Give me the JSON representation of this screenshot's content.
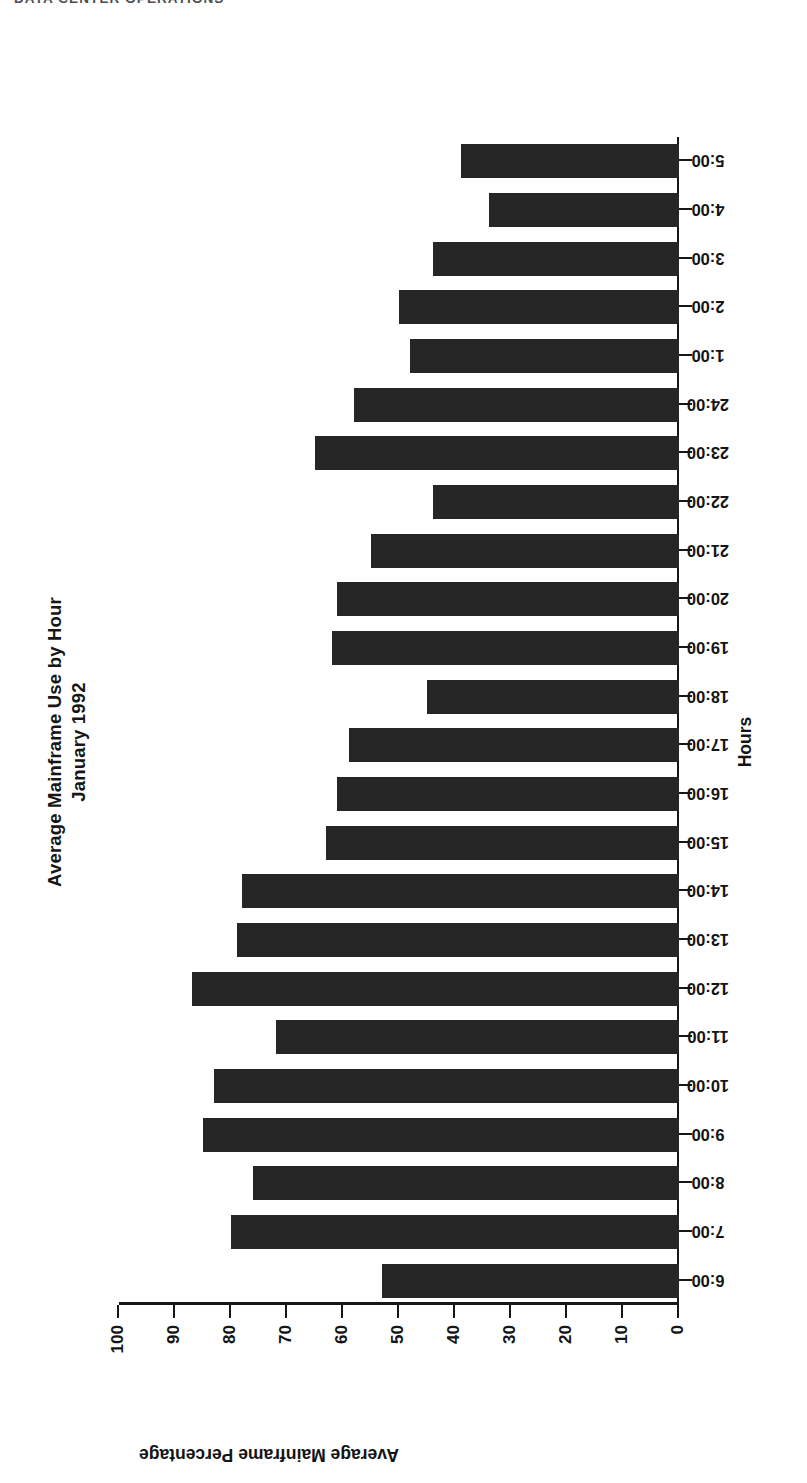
{
  "page": {
    "header_text": "DATA CENTER OPERATIONS"
  },
  "chart_data": {
    "type": "bar",
    "orientation": "horizontal-on-page",
    "title": "Average Mainframe Use by Hour",
    "subtitle": "January 1992",
    "xlabel": "Hours",
    "ylabel": "Average Mainframe Percentage",
    "ylim": [
      0,
      100
    ],
    "ytick_labels": [
      "0",
      "10",
      "20",
      "30",
      "40",
      "50",
      "60",
      "70",
      "80",
      "90",
      "100"
    ],
    "ytick_values": [
      0,
      10,
      20,
      30,
      40,
      50,
      60,
      70,
      80,
      90,
      100
    ],
    "grid": false,
    "legend": false,
    "categories": [
      "6:00",
      "7:00",
      "8:00",
      "9:00",
      "10:00",
      "11:00",
      "12:00",
      "13:00",
      "14:00",
      "15:00",
      "16:00",
      "17:00",
      "18:00",
      "19:00",
      "20:00",
      "21:00",
      "22:00",
      "23:00",
      "24:00",
      "1:00",
      "2:00",
      "3:00",
      "4:00",
      "5:00"
    ],
    "values": [
      53,
      80,
      76,
      85,
      83,
      72,
      87,
      79,
      78,
      63,
      61,
      59,
      45,
      62,
      61,
      55,
      44,
      65,
      58,
      48,
      50,
      44,
      34,
      39
    ],
    "bar_color": "#262626",
    "axis_color": "#171717"
  }
}
